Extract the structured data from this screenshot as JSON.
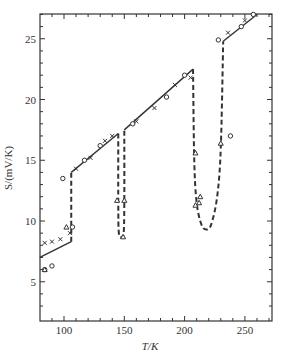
{
  "chart_data": {
    "type": "line",
    "title": "",
    "xlabel": "T/K",
    "ylabel": "S/(mV/K)",
    "xlim": [
      80,
      272
    ],
    "ylim": [
      2,
      27
    ],
    "xticks": [
      100,
      150,
      200,
      250
    ],
    "yticks": [
      5,
      10,
      15,
      20,
      25
    ],
    "grid": false,
    "legend": null,
    "series": [
      {
        "name": "low-T solid fit",
        "style": "solid",
        "points": [
          [
            80,
            7.0
          ],
          [
            106,
            8.3
          ]
        ]
      },
      {
        "name": "dashed jump ~106 K",
        "style": "dashed",
        "points": [
          [
            106,
            8.3
          ],
          [
            106,
            14.0
          ]
        ]
      },
      {
        "name": "segment 106-145 K",
        "style": "solid",
        "points": [
          [
            106,
            14.0
          ],
          [
            145,
            17.2
          ]
        ]
      },
      {
        "name": "dip ~145-150 K",
        "style": "dashed",
        "points": [
          [
            145,
            17.2
          ],
          [
            145,
            11.5
          ],
          [
            145.5,
            9.0
          ],
          [
            148,
            8.7
          ],
          [
            149.5,
            9.0
          ],
          [
            150,
            11.5
          ],
          [
            150,
            17.5
          ]
        ]
      },
      {
        "name": "segment 150-207 K",
        "style": "solid",
        "points": [
          [
            150,
            17.5
          ],
          [
            207,
            22.5
          ]
        ]
      },
      {
        "name": "dip ~207-232 K",
        "style": "dashed",
        "points": [
          [
            207,
            22.5
          ],
          [
            208,
            15.0
          ],
          [
            210,
            11.5
          ],
          [
            214,
            9.7
          ],
          [
            218,
            9.3
          ],
          [
            222,
            9.7
          ],
          [
            227,
            12.0
          ],
          [
            230,
            16.0
          ],
          [
            232,
            24.8
          ]
        ]
      },
      {
        "name": "segment 232-265 K",
        "style": "solid",
        "points": [
          [
            232,
            24.8
          ],
          [
            260,
            27.0
          ]
        ]
      }
    ],
    "markers": [
      {
        "shape": "circle",
        "points": [
          [
            99,
            13.5
          ],
          [
            107,
            9.5
          ],
          [
            84,
            6.0
          ],
          [
            90,
            6.3
          ],
          [
            117,
            15.0
          ],
          [
            130,
            16.2
          ],
          [
            157,
            18.0
          ],
          [
            185,
            20.2
          ],
          [
            200,
            22.0
          ],
          [
            228,
            24.9
          ],
          [
            238,
            17.0
          ],
          [
            247,
            26.0
          ],
          [
            257,
            27.0
          ]
        ]
      },
      {
        "shape": "triangle",
        "points": [
          [
            84,
            6.0
          ],
          [
            102,
            9.5
          ],
          [
            144,
            11.7
          ],
          [
            150,
            11.7
          ],
          [
            149,
            8.7
          ],
          [
            209,
            11.3
          ],
          [
            212,
            11.5
          ],
          [
            213,
            12.0
          ],
          [
            230,
            16.4
          ],
          [
            209,
            15.6
          ]
        ]
      },
      {
        "shape": "cross",
        "points": [
          [
            84,
            8.2
          ],
          [
            90,
            8.3
          ],
          [
            97,
            8.5
          ],
          [
            105,
            9.0
          ],
          [
            110,
            14.3
          ],
          [
            122,
            15.2
          ],
          [
            134,
            16.6
          ],
          [
            140,
            17.0
          ],
          [
            160,
            18.2
          ],
          [
            175,
            19.3
          ],
          [
            192,
            21.2
          ],
          [
            205,
            21.8
          ],
          [
            236,
            25.5
          ],
          [
            250,
            26.5
          ]
        ]
      }
    ]
  },
  "axes": {
    "xlabel": "T/K",
    "ylabel": "S/(mV/K)",
    "xtick_labels": [
      "100",
      "150",
      "200",
      "250"
    ],
    "ytick_labels": [
      "5",
      "10",
      "15",
      "20",
      "25"
    ]
  }
}
